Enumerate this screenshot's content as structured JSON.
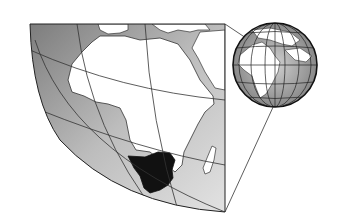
{
  "figure": {
    "description": "Map of Africa with southern Africa region highlighted, with locator globe inset",
    "highlighted_region": "Southern Africa",
    "colors": {
      "ocean_dark": "#8c8c8c",
      "ocean_light": "#d8d8d8",
      "land": "#ffffff",
      "highlight": "#111111",
      "graticule": "#333333",
      "border": "#222222"
    }
  },
  "inset": {
    "type": "locator-globe"
  }
}
